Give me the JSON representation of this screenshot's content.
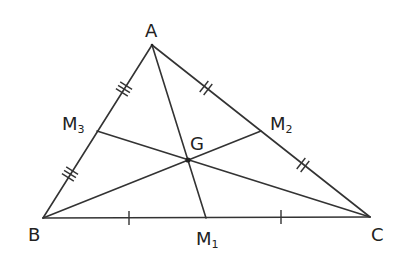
{
  "diagram": {
    "stroke_color": "#333333",
    "points": {
      "A": {
        "label": "A",
        "x": 152,
        "y": 45
      },
      "B": {
        "label": "B",
        "x": 43,
        "y": 218
      },
      "C": {
        "label": "C",
        "x": 370,
        "y": 217
      },
      "M1": {
        "label": "M",
        "sub": "1",
        "x": 206,
        "y": 218
      },
      "M2": {
        "label": "M",
        "sub": "2",
        "x": 261,
        "y": 131
      },
      "M3": {
        "label": "M",
        "sub": "3",
        "x": 97,
        "y": 131
      },
      "G": {
        "label": "G",
        "x": 188,
        "y": 160
      }
    },
    "sides": [
      "AB",
      "BC",
      "CA"
    ],
    "medians": [
      "AM1",
      "BM2",
      "CM3"
    ],
    "tick_marks": {
      "BC": {
        "count": 1,
        "positions": [
          "BM1 midpoint",
          "M1C midpoint"
        ]
      },
      "CA": {
        "count": 2,
        "positions": [
          "AM2 midpoint",
          "M2C midpoint"
        ]
      },
      "AB": {
        "count": 3,
        "positions": [
          "AM3 midpoint",
          "M3B midpoint"
        ]
      }
    }
  }
}
